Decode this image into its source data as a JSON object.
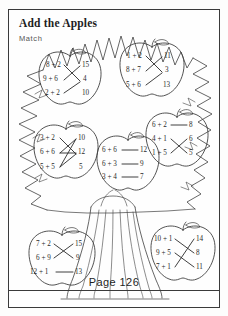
{
  "worksheet": {
    "title": "Add the Apples",
    "instruction": "Match",
    "page_label": "Page 126"
  },
  "theme": {
    "ink": "#2a2a2a",
    "line": "#3a3a3a",
    "paper": "#fefefe"
  },
  "artwork": {
    "tree_canopy": "zigzag-leaf-border",
    "trunk": "tree-trunk-icon",
    "apple_shape": "apple-icon"
  },
  "apples": [
    {
      "id": "apple-top-left",
      "problems": [
        "8 + 2",
        "9 + 6",
        "2 + 2"
      ],
      "answers": [
        "15",
        "4",
        "10"
      ]
    },
    {
      "id": "apple-top-right",
      "problems": [
        "1 + 2",
        "8 + 7",
        "5 + 6"
      ],
      "answers": [
        "11",
        "3",
        "13"
      ]
    },
    {
      "id": "apple-middle-left",
      "problems": [
        "3 + 2",
        "6 + 6",
        "5 + 5"
      ],
      "answers": [
        "10",
        "12",
        "5"
      ]
    },
    {
      "id": "apple-center",
      "problems": [
        "6 + 6",
        "6 + 3",
        "3 + 4"
      ],
      "answers": [
        "12",
        "9",
        "7"
      ]
    },
    {
      "id": "apple-middle-right",
      "problems": [
        "6 + 2",
        "4 + 1",
        "1 + 5"
      ],
      "answers": [
        "8",
        "6",
        "5"
      ]
    },
    {
      "id": "apple-bottom-left",
      "problems": [
        "7 + 2",
        "6 + 9",
        "12 + 1"
      ],
      "answers": [
        "15",
        "9",
        "13"
      ]
    },
    {
      "id": "apple-bottom-right",
      "problems": [
        "10 + 1",
        "9 + 5",
        "7 + 1"
      ],
      "answers": [
        "14",
        "8",
        "11"
      ]
    }
  ]
}
